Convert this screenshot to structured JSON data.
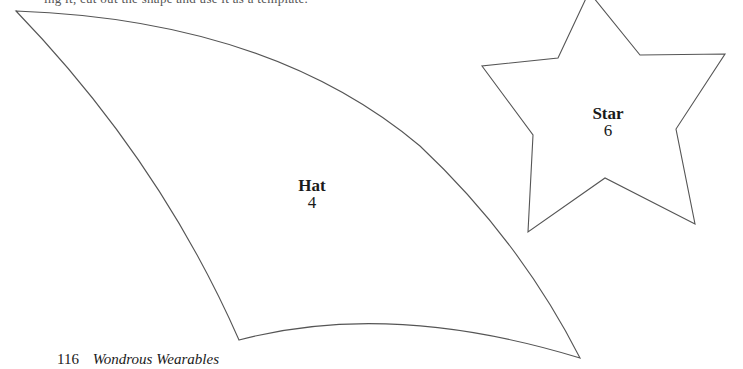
{
  "page": {
    "top_text_cut": "ing it, cut out the shape and use it as a template.",
    "footer": {
      "page_number": "116",
      "book_title": "Wondrous Wearables"
    }
  },
  "shapes": [
    {
      "id": "hat",
      "name": "Hat",
      "number": "4",
      "stroke": "#555555"
    },
    {
      "id": "star",
      "name": "Star",
      "number": "6",
      "stroke": "#555555"
    }
  ]
}
